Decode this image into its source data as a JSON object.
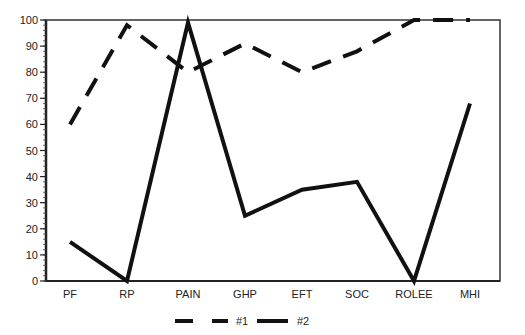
{
  "chart_data": {
    "type": "line",
    "title": "",
    "xlabel": "",
    "ylabel": "",
    "categories": [
      "PF",
      "RP",
      "PAIN",
      "GHP",
      "EFT",
      "SOC",
      "ROLEE",
      "MHI"
    ],
    "series": [
      {
        "name": "#1",
        "style": "dashed",
        "color": "#111111",
        "values": [
          60,
          98,
          80,
          91,
          80,
          88,
          100,
          100
        ]
      },
      {
        "name": "#2",
        "style": "solid",
        "color": "#111111",
        "values": [
          15,
          0,
          99,
          25,
          35,
          38,
          0,
          68
        ]
      }
    ],
    "ylim": [
      0,
      100
    ],
    "yticks": [
      0,
      10,
      20,
      30,
      40,
      50,
      60,
      70,
      80,
      90,
      100
    ],
    "grid": false,
    "legend_position": "bottom"
  }
}
